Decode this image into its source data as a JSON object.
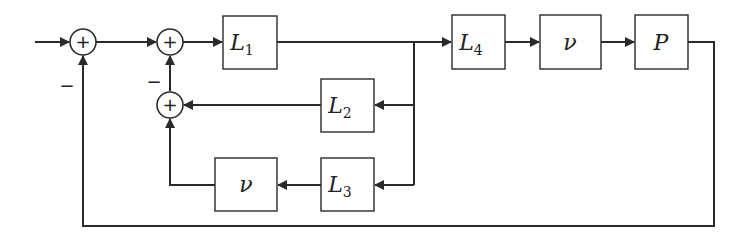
{
  "diagram": {
    "type": "control block diagram",
    "summing_junctions": [
      {
        "id": "sum1",
        "symbol": "+",
        "minus_label": "−"
      },
      {
        "id": "sum2",
        "symbol": "+",
        "minus_label": "−"
      },
      {
        "id": "sum3",
        "symbol": "+"
      }
    ],
    "blocks": {
      "L1": {
        "base": "L",
        "sub": "1"
      },
      "L2": {
        "base": "L",
        "sub": "2"
      },
      "L3": {
        "base": "L",
        "sub": "3"
      },
      "L4": {
        "base": "L",
        "sub": "4"
      },
      "nu_forward": {
        "base": "ν"
      },
      "nu_feedback": {
        "base": "ν"
      },
      "P": {
        "base": "P"
      }
    },
    "colors": {
      "stroke": "#2a2a2a",
      "background": "#ffffff"
    }
  }
}
